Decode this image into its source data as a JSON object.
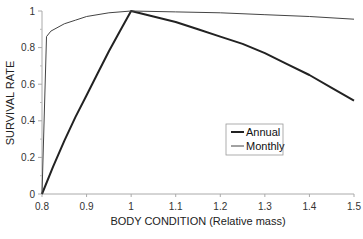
{
  "chart_data": {
    "type": "line",
    "title": "",
    "xlabel": "BODY CONDITION (Relative mass)",
    "ylabel": "SURVIVAL RATE",
    "xlim": [
      0.8,
      1.5
    ],
    "ylim": [
      0,
      1
    ],
    "x_ticks": [
      0.8,
      0.9,
      1,
      1.1,
      1.2,
      1.3,
      1.4,
      1.5
    ],
    "x_tick_labels": [
      "0.8",
      "0.9",
      "1",
      "1.1",
      "1.2",
      "1.3",
      "1.4",
      "1.5"
    ],
    "y_ticks": [
      0,
      0.2,
      0.4,
      0.6,
      0.8,
      1
    ],
    "y_tick_labels": [
      "0",
      "0.2",
      "0.4",
      "0.6",
      "0.8",
      "1"
    ],
    "grid": false,
    "legend_position": "inside right-center",
    "series": [
      {
        "name": "Annual",
        "color": "#222222",
        "line_width": 2,
        "x": [
          0.8,
          0.825,
          0.85,
          0.875,
          0.9,
          0.925,
          0.95,
          0.975,
          1.0,
          1.05,
          1.1,
          1.15,
          1.2,
          1.25,
          1.3,
          1.35,
          1.4,
          1.45,
          1.5
        ],
        "values": [
          0.0,
          0.15,
          0.29,
          0.42,
          0.54,
          0.66,
          0.78,
          0.89,
          1.0,
          0.97,
          0.94,
          0.9,
          0.86,
          0.82,
          0.77,
          0.71,
          0.65,
          0.58,
          0.51
        ]
      },
      {
        "name": "Monthly",
        "color": "#444444",
        "line_width": 1,
        "x": [
          0.8,
          0.81,
          0.82,
          0.85,
          0.875,
          0.9,
          0.95,
          1.0,
          1.1,
          1.2,
          1.3,
          1.4,
          1.5
        ],
        "values": [
          0.0,
          0.86,
          0.89,
          0.93,
          0.95,
          0.97,
          0.99,
          1.0,
          0.995,
          0.99,
          0.98,
          0.97,
          0.955
        ]
      }
    ]
  },
  "legend": {
    "items": [
      {
        "label": "Annual"
      },
      {
        "label": "Monthly"
      }
    ]
  }
}
